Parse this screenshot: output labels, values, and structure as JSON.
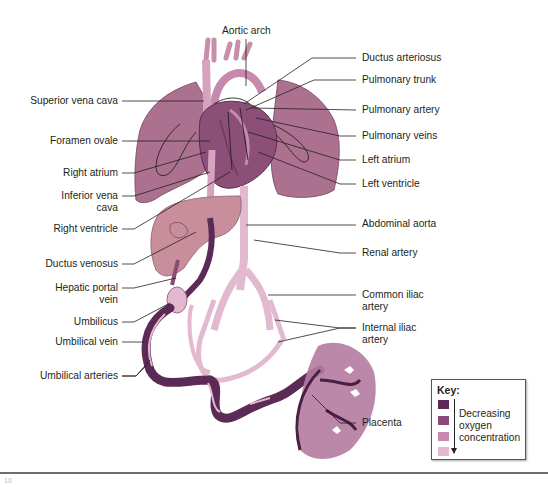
{
  "figure": {
    "colors": {
      "key_swatch_1": "#5b2a55",
      "key_swatch_2": "#8a4b7a",
      "key_swatch_3": "#c58aae",
      "key_swatch_4": "#e3b9cf",
      "lung": "#a86a8a",
      "heart": "#8c4f78",
      "liver": "#c98e9c",
      "vessel_light": "#e3b9cf",
      "vessel_dark": "#5b2a55",
      "placenta": "#b57ba0",
      "leader_line": "#231f20"
    }
  },
  "labels": {
    "aortic_arch": "Aortic arch",
    "ductus_arteriosus": "Ductus arteriosus",
    "pulmonary_trunk": "Pulmonary trunk",
    "pulmonary_artery": "Pulmonary artery",
    "pulmonary_veins": "Pulmonary veins",
    "left_atrium": "Left atrium",
    "left_ventricle": "Left ventricle",
    "abdominal_aorta": "Abdominal aorta",
    "renal_artery": "Renal artery",
    "common_iliac_artery_1": "Common iliac",
    "common_iliac_artery_2": "artery",
    "internal_iliac_artery_1": "Internal iliac",
    "internal_iliac_artery_2": "artery",
    "placenta": "Placenta",
    "superior_vena_cava": "Superior vena cava",
    "foramen_ovale": "Foramen ovale",
    "right_atrium": "Right atrium",
    "inferior_vena_cava_1": "Inferior vena",
    "inferior_vena_cava_2": "cava",
    "right_ventricle": "Right ventricle",
    "ductus_venosus": "Ductus venosus",
    "hepatic_portal_vein_1": "Hepatic portal",
    "hepatic_portal_vein_2": "vein",
    "umbilicus": "Umbilicus",
    "umbilical_vein": "Umbilical vein",
    "umbilical_arteries": "Umbilical arteries"
  },
  "key": {
    "title": "Key:",
    "text_1": "Decreasing",
    "text_2": "oxygen",
    "text_3": "concentration"
  },
  "footer": {
    "page_number": "10"
  }
}
